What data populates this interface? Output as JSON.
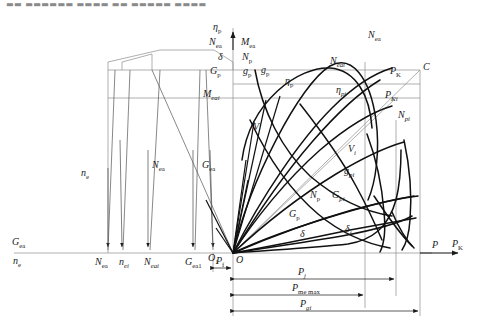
{
  "figure": {
    "type": "engineering-line-diagram",
    "title_clipped": "▬▬ ▬▬▬▬▬▬ ▬▬▬▬ ▬▬ ▬▬▬▬▬ ▬▬▬▬▬ ▬ ▬▬ ▬▬ ▬▬▬▬▬",
    "background": "#ffffff",
    "line_color": "#1a1a1a",
    "thin_line_color": "#8c8c8c"
  },
  "axes": {
    "vertical_axis_left_stack": [
      {
        "id": "eta-p",
        "base": "η",
        "sub": "p"
      },
      {
        "id": "N-ea",
        "base": "N",
        "sub": "ea"
      },
      {
        "id": "delta",
        "base": "δ",
        "sub": ""
      },
      {
        "id": "G-p",
        "base": "G",
        "sub": "p"
      }
    ],
    "vertical_axis_right_stack": [
      {
        "id": "M-ea",
        "base": "M",
        "sub": "ea"
      },
      {
        "id": "N-p",
        "base": "N",
        "sub": "p"
      },
      {
        "id": "g-p",
        "base": "g",
        "sub": "p"
      }
    ],
    "left_axis_labels": [
      {
        "id": "G-ea-left",
        "base": "G",
        "sub": "ea"
      },
      {
        "id": "n-e-left",
        "base": "n",
        "sub": "e"
      }
    ],
    "right_axis_labels": [
      {
        "id": "P-axis",
        "base": "P",
        "sub": ""
      },
      {
        "id": "P-K-axis",
        "base": "P",
        "sub": "K"
      }
    ]
  },
  "tick_labels": [
    {
      "id": "tick-N-ea",
      "base": "N",
      "sub": "ea"
    },
    {
      "id": "tick-n-ei",
      "base": "n",
      "sub": "ei",
      "sub_italic": true
    },
    {
      "id": "tick-N-eai",
      "base": "N",
      "sub": "eai",
      "sub_italic": true
    },
    {
      "id": "tick-G-ea1",
      "base": "G",
      "sub": "ea1"
    },
    {
      "id": "tick-O1",
      "base": "O",
      "sub": "1"
    },
    {
      "id": "tick-P-f",
      "base": "P",
      "sub": "f"
    },
    {
      "id": "tick-O",
      "base": "O",
      "sub": ""
    }
  ],
  "curve_labels": [
    {
      "id": "curve-n-e",
      "base": "n",
      "sub": "e"
    },
    {
      "id": "curve-N-ea",
      "base": "N",
      "sub": "ea"
    },
    {
      "id": "curve-G-ea",
      "base": "G",
      "sub": "ea"
    },
    {
      "id": "curve-M-eai",
      "base": "M",
      "sub": "eai",
      "sub_italic": true
    },
    {
      "id": "curve-g-p",
      "base": "g",
      "sub": "p"
    },
    {
      "id": "curve-eta-p",
      "base": "η",
      "sub": "p"
    },
    {
      "id": "curve-eta-pi",
      "base": "η",
      "sub": "pi",
      "sub_italic": true
    },
    {
      "id": "curve-N-eai",
      "base": "N",
      "sub": "eai",
      "sub_italic": true
    },
    {
      "id": "curve-N-ea-top",
      "base": "N",
      "sub": "ea"
    },
    {
      "id": "curve-C",
      "base": "C",
      "sub": ""
    },
    {
      "id": "curve-P-K",
      "base": "P",
      "sub": "K"
    },
    {
      "id": "curve-P-Ki",
      "base": "P",
      "sub": "Ki",
      "sub_italic": true
    },
    {
      "id": "curve-N-pi",
      "base": "N",
      "sub": "pi",
      "sub_italic": true
    },
    {
      "id": "curve-V",
      "base": "V",
      "sub": ""
    },
    {
      "id": "curve-V-i",
      "base": "V",
      "sub": "i",
      "sub_italic": true
    },
    {
      "id": "curve-g-pi",
      "base": "g",
      "sub": "pi",
      "sub_italic": true
    },
    {
      "id": "curve-N-p",
      "base": "N",
      "sub": "p"
    },
    {
      "id": "curve-G-pi",
      "base": "G",
      "sub": "pi",
      "sub_italic": true
    },
    {
      "id": "curve-G-p",
      "base": "G",
      "sub": "p"
    },
    {
      "id": "curve-delta",
      "base": "δ",
      "sub": ""
    },
    {
      "id": "curve-delta-i",
      "base": "δ",
      "sub": "i",
      "sub_italic": true
    }
  ],
  "dimension_labels": [
    {
      "id": "dim-P-f",
      "base": "P",
      "sub": "f"
    },
    {
      "id": "dim-P-j",
      "base": "P",
      "sub": "j",
      "sub_italic": true
    },
    {
      "id": "dim-P-me-max",
      "base": "P",
      "sub": "me max"
    },
    {
      "id": "dim-P-gi",
      "base": "P",
      "sub": "gi",
      "sub_italic": true
    }
  ]
}
